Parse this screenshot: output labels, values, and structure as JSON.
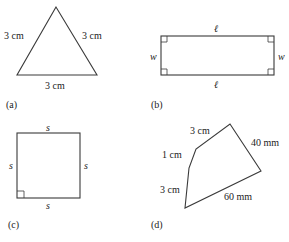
{
  "figures": {
    "a": {
      "caption": "(a)",
      "shape": "equilateral-triangle",
      "labels": {
        "left": "3 cm",
        "right": "3 cm",
        "bottom": "3 cm"
      }
    },
    "b": {
      "caption": "(b)",
      "shape": "rectangle",
      "labels": {
        "top": "ℓ",
        "bottom": "ℓ",
        "left": "w",
        "right": "w"
      },
      "right_angle_marks": 4
    },
    "c": {
      "caption": "(c)",
      "shape": "square",
      "labels": {
        "top": "s",
        "bottom": "s",
        "left": "s",
        "right": "s"
      },
      "right_angle_marks": 1
    },
    "d": {
      "caption": "(d)",
      "shape": "pentagon",
      "labels": {
        "top_left": "3 cm",
        "top_right": "40 mm",
        "left_upper": "1 cm",
        "left_lower": "3 cm",
        "bottom": "60 mm"
      }
    }
  },
  "colors": {
    "stroke": "#3a3a3a",
    "text": "#222222",
    "background": "#ffffff"
  }
}
